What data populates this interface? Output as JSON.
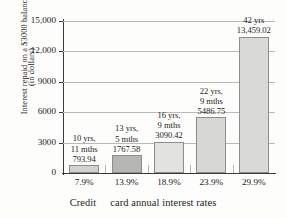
{
  "chart_data": {
    "type": "bar",
    "title": "",
    "xlabel": "Credit card annual interest rates",
    "xlabel_part1": "Credit",
    "xlabel_part2": "card annual interest rates",
    "ylabel": "Interest repaid on a $3000 balance (in dollars)",
    "ylabel_line1": "Interest repaid on a $3000 balance",
    "ylabel_line2": "(in dollars)",
    "categories": [
      "7.9%",
      "13.9%",
      "18.9%",
      "23.9%",
      "29.9%"
    ],
    "values": [
      793.94,
      1767.58,
      3090.42,
      5486.75,
      13459.02
    ],
    "value_labels": [
      "793.94",
      "1767.58",
      "3090.42",
      "5486.75",
      "13,459.02"
    ],
    "duration_labels": [
      [
        "10 yrs,",
        "11 mths"
      ],
      [
        "13 yrs,",
        "5 mths"
      ],
      [
        "16 yrs,",
        "9 mths"
      ],
      [
        "22 yrs,",
        "9 mths"
      ],
      [
        "42 yrs"
      ]
    ],
    "ylim": [
      0,
      15000
    ],
    "yticks": [
      0,
      3000,
      6000,
      9000,
      12000,
      15000
    ],
    "ytick_labels": [
      "0",
      "3000",
      "6000",
      "9000",
      "12,000",
      "15,000"
    ],
    "grid": true,
    "legend": false,
    "bar_colors": [
      "#d2d2cf",
      "#b5b5b2",
      "#e2e2df",
      "#d7d7d4",
      "#d9d9d6"
    ],
    "bar_border_color": "#8d8d8d",
    "axis_color": "#3a3a3a",
    "gridline_color": "#b9b9b9",
    "background": "#fdfdfb"
  }
}
